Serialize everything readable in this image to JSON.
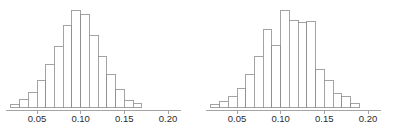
{
  "figure": {
    "title": "",
    "background_color": "#ffffff",
    "panel_count": 2,
    "axis_color": "#8c8c8c",
    "bar_stroke_color": "#8c8c8c",
    "bar_fill_color": "#ffffff",
    "label_color": "#2b2b2b"
  },
  "chart_data": [
    {
      "type": "bar",
      "subtype": "histogram",
      "panel": "left",
      "title": "",
      "xlabel": "",
      "ylabel": "",
      "xlim": [
        0.015,
        0.215
      ],
      "ylim": [
        0,
        100
      ],
      "grid": false,
      "legend": null,
      "bin_width": 0.01,
      "tick_values": [
        0.05,
        0.1,
        0.15,
        0.2
      ],
      "tick_labels": [
        "0.05",
        "0.10",
        "0.15",
        "0.20"
      ],
      "bin_left_edges": [
        0.02,
        0.03,
        0.04,
        0.05,
        0.06,
        0.07,
        0.08,
        0.09,
        0.1,
        0.11,
        0.12,
        0.13,
        0.14,
        0.15,
        0.16
      ],
      "bin_centers": [
        0.025,
        0.035,
        0.045,
        0.055,
        0.065,
        0.075,
        0.085,
        0.095,
        0.105,
        0.115,
        0.125,
        0.135,
        0.145,
        0.155,
        0.165
      ],
      "categories": [
        "0.02-0.03",
        "0.03-0.04",
        "0.04-0.05",
        "0.05-0.06",
        "0.06-0.07",
        "0.07-0.08",
        "0.08-0.09",
        "0.09-0.10",
        "0.10-0.11",
        "0.11-0.12",
        "0.12-0.13",
        "0.13-0.14",
        "0.14-0.15",
        "0.15-0.16",
        "0.16-0.17"
      ],
      "values": [
        3,
        8,
        15,
        27,
        44,
        62,
        84,
        100,
        95,
        74,
        52,
        33,
        18,
        7,
        4
      ]
    },
    {
      "type": "bar",
      "subtype": "histogram",
      "panel": "right",
      "title": "",
      "xlabel": "",
      "ylabel": "",
      "xlim": [
        0.015,
        0.215
      ],
      "ylim": [
        0,
        100
      ],
      "grid": false,
      "legend": null,
      "bin_width": 0.01,
      "tick_values": [
        0.05,
        0.1,
        0.15,
        0.2
      ],
      "tick_labels": [
        "0.05",
        "0.10",
        "0.15",
        "0.20"
      ],
      "bin_left_edges": [
        0.02,
        0.03,
        0.04,
        0.05,
        0.06,
        0.07,
        0.08,
        0.09,
        0.1,
        0.11,
        0.12,
        0.13,
        0.14,
        0.15,
        0.16,
        0.17,
        0.18
      ],
      "bin_centers": [
        0.025,
        0.035,
        0.045,
        0.055,
        0.065,
        0.075,
        0.085,
        0.095,
        0.105,
        0.115,
        0.125,
        0.135,
        0.145,
        0.155,
        0.165,
        0.175,
        0.185
      ],
      "categories": [
        "0.02-0.03",
        "0.03-0.04",
        "0.04-0.05",
        "0.05-0.06",
        "0.06-0.07",
        "0.07-0.08",
        "0.08-0.09",
        "0.09-0.10",
        "0.10-0.11",
        "0.11-0.12",
        "0.12-0.13",
        "0.13-0.14",
        "0.14-0.15",
        "0.15-0.16",
        "0.16-0.17",
        "0.17-0.18",
        "0.18-0.19"
      ],
      "values": [
        3,
        6,
        11,
        19,
        33,
        52,
        80,
        63,
        100,
        89,
        87,
        88,
        39,
        27,
        14,
        11,
        4
      ]
    }
  ]
}
